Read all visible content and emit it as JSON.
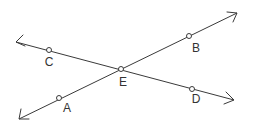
{
  "diagram": {
    "type": "intersecting-lines",
    "lines": [
      {
        "id": "line-AB",
        "from": {
          "x": 19,
          "y": 119
        },
        "to": {
          "x": 237,
          "y": 13
        },
        "arrows": "both"
      },
      {
        "id": "line-CD",
        "from": {
          "x": 16,
          "y": 42
        },
        "to": {
          "x": 234,
          "y": 100
        },
        "arrows": "both"
      }
    ],
    "points": [
      {
        "label": "A",
        "x": 59,
        "y": 98,
        "lx": 67,
        "ly": 112
      },
      {
        "label": "B",
        "x": 189,
        "y": 36,
        "lx": 196,
        "ly": 52
      },
      {
        "label": "C",
        "x": 49,
        "y": 50,
        "lx": 49,
        "ly": 66
      },
      {
        "label": "D",
        "x": 192,
        "y": 89,
        "lx": 196,
        "ly": 103
      },
      {
        "label": "E",
        "x": 121,
        "y": 69,
        "lx": 123,
        "ly": 86
      }
    ],
    "labels": {
      "A": "A",
      "B": "B",
      "C": "C",
      "D": "D",
      "E": "E"
    }
  }
}
